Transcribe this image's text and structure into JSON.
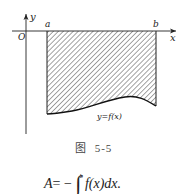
{
  "figure": {
    "axis_labels": {
      "y": "y",
      "x": "x",
      "origin": "O",
      "a": "a",
      "b": "b"
    },
    "curve_label": "y=f(x)",
    "caption": {
      "prefix": "图",
      "number": "5-5"
    }
  },
  "formula": {
    "lhs": "A",
    "eq": "= −",
    "integral": "∫",
    "upper": "b",
    "body": "f(x)dx."
  }
}
